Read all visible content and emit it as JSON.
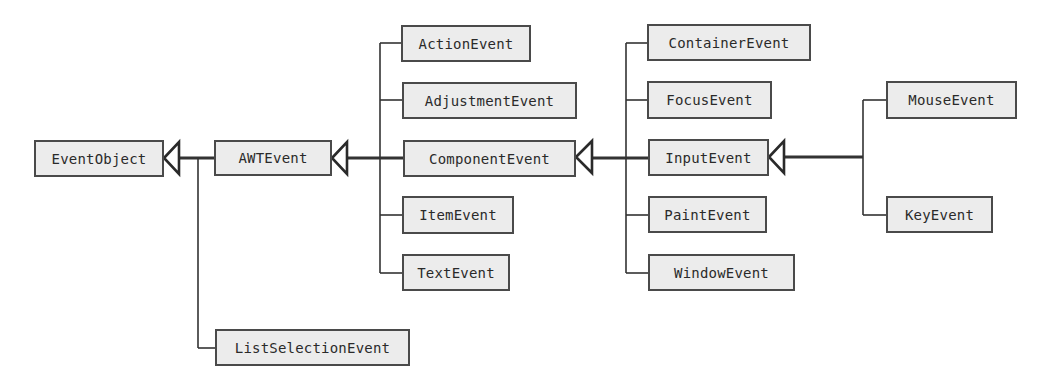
{
  "diagram": {
    "title": "",
    "type": "class-hierarchy",
    "colors": {
      "box_fill": "#ececec",
      "box_border": "#4a4a4a",
      "line": "#333333",
      "text": "#2a2a2a"
    },
    "classes": {
      "eventobject": "EventObject",
      "awtevent": "AWTEvent",
      "listselectionevent": "ListSelectionEvent",
      "actionevent": "ActionEvent",
      "adjustmentevent": "AdjustmentEvent",
      "componentevent": "ComponentEvent",
      "itemevent": "ItemEvent",
      "textevent": "TextEvent",
      "containerevent": "ContainerEvent",
      "focusevent": "FocusEvent",
      "inputevent": "InputEvent",
      "paintevent": "PaintEvent",
      "windowevent": "WindowEvent",
      "mouseevent": "MouseEvent",
      "keyevent": "KeyEvent"
    },
    "inheritance": [
      {
        "parent": "EventObject",
        "children": [
          "AWTEvent",
          "ListSelectionEvent"
        ]
      },
      {
        "parent": "AWTEvent",
        "children": [
          "ActionEvent",
          "AdjustmentEvent",
          "ComponentEvent",
          "ItemEvent",
          "TextEvent"
        ]
      },
      {
        "parent": "ComponentEvent",
        "children": [
          "ContainerEvent",
          "FocusEvent",
          "InputEvent",
          "PaintEvent",
          "WindowEvent"
        ]
      },
      {
        "parent": "InputEvent",
        "children": [
          "MouseEvent",
          "KeyEvent"
        ]
      }
    ]
  }
}
